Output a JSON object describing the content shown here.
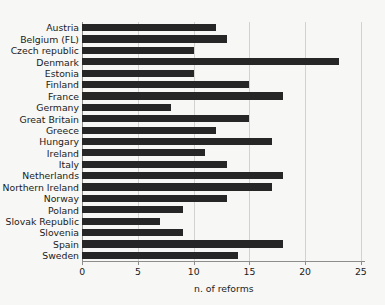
{
  "chart_data": {
    "type": "bar",
    "orientation": "horizontal",
    "title": "",
    "xlabel": "n. of reforms",
    "ylabel": "",
    "xlim": [
      0,
      25.4
    ],
    "xticks": [
      0,
      5,
      10,
      15,
      20,
      25
    ],
    "xtick_labels": [
      "0",
      "5",
      "10",
      "15",
      "20",
      "25"
    ],
    "grid": "vertical",
    "legend": null,
    "bar_color": "#262626",
    "background_color": "#f7f7f5",
    "axis_color": "#8d8d8b",
    "gridline_color": "#d2d2d0",
    "categories": [
      "Austria",
      "Belgium (FL)",
      "Czech republic",
      "Denmark",
      "Estonia",
      "Finland",
      "France",
      "Germany",
      "Great Britain",
      "Greece",
      "Hungary",
      "Ireland",
      "Italy",
      "Netherlands",
      "Northern Ireland",
      "Norway",
      "Poland",
      "Slovak Republic",
      "Slovenia",
      "Spain",
      "Sweden"
    ],
    "values": [
      12,
      13,
      10,
      23,
      10,
      15,
      18,
      8,
      15,
      12,
      17,
      11,
      13,
      18,
      17,
      13,
      9,
      7,
      9,
      18,
      14
    ]
  }
}
